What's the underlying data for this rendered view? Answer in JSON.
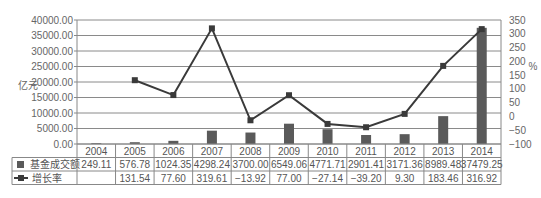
{
  "chart_data": {
    "type": "bar+line",
    "title": "",
    "categories": [
      "2004",
      "2005",
      "2006",
      "2007",
      "2008",
      "2009",
      "2010",
      "2011",
      "2012",
      "2013",
      "2014"
    ],
    "series": [
      {
        "name": "基金成交额",
        "type": "bar",
        "axis": "left",
        "values": [
          249.11,
          576.78,
          1024.35,
          4298.24,
          3700.0,
          6549.06,
          4771.71,
          2901.41,
          3171.36,
          8989.48,
          37479.25
        ],
        "labels": [
          "249.11",
          "576.78",
          "1024.35",
          "4298.24",
          "3700.00",
          "6549.06",
          "4771.71",
          "2901.41",
          "3171.36",
          "8989.48",
          "37479.25"
        ]
      },
      {
        "name": "增长率",
        "type": "line",
        "axis": "right",
        "values": [
          null,
          131.54,
          77.6,
          319.61,
          -13.92,
          77.0,
          -27.14,
          -39.2,
          9.3,
          183.46,
          316.92
        ],
        "labels": [
          "",
          "131.54",
          "77.60",
          "319.61",
          "−13.92",
          "77.00",
          "−27.14",
          "−39.20",
          "9.30",
          "183.46",
          "316.92"
        ]
      }
    ],
    "ylabel": "亿元",
    "y2label": "%",
    "ylim": [
      0,
      40000
    ],
    "y2lim": [
      -100,
      350
    ],
    "yticks": [
      "0.00",
      "5000.00",
      "10000.00",
      "15000.00",
      "20000.00",
      "25000.00",
      "30000.00",
      "35000.00",
      "40000.00"
    ],
    "y2ticks": [
      "−100",
      "−50",
      "0",
      "50",
      "100",
      "150",
      "200",
      "250",
      "300",
      "350"
    ],
    "grid": true,
    "legend": "data-table"
  }
}
